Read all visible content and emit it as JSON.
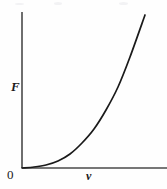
{
  "figure": {
    "background_color": "#fefefe",
    "ink_color": "#1a1a1a",
    "width": 167,
    "height": 189
  },
  "labels": {
    "y_axis": "F",
    "x_axis": "v",
    "origin": "0"
  },
  "chart_data": {
    "type": "line",
    "title": "",
    "subtitle": "",
    "xlabel": "v",
    "ylabel": "F",
    "grid": false,
    "legend": null,
    "annotations": [
      "0"
    ],
    "xlim": [
      0,
      1
    ],
    "ylim": [
      0,
      1
    ],
    "axis_ticks": {
      "x": [],
      "y": []
    },
    "series": [
      {
        "name": "F vs v",
        "relation": "F proportional to v^2.5",
        "x": [
          0.0,
          0.1,
          0.2,
          0.3,
          0.4,
          0.5,
          0.6,
          0.7,
          0.8,
          0.9,
          1.0
        ],
        "y": [
          0.0,
          0.003,
          0.018,
          0.049,
          0.101,
          0.177,
          0.279,
          0.41,
          0.572,
          0.768,
          1.0
        ]
      }
    ],
    "curve_pixels": {
      "origin": [
        22,
        168
      ],
      "end": [
        145,
        15
      ],
      "points": [
        [
          22,
          168
        ],
        [
          34,
          167
        ],
        [
          46,
          165
        ],
        [
          58,
          161
        ],
        [
          70,
          154
        ],
        [
          82,
          143
        ],
        [
          94,
          129
        ],
        [
          106,
          110
        ],
        [
          118,
          87
        ],
        [
          130,
          57
        ],
        [
          145,
          15
        ]
      ]
    },
    "axes_pixels": {
      "y_axis": {
        "x": 22,
        "y_top": 12,
        "y_bottom": 168
      },
      "x_axis": {
        "y": 168,
        "x_left": 22,
        "x_right": 167
      }
    }
  }
}
